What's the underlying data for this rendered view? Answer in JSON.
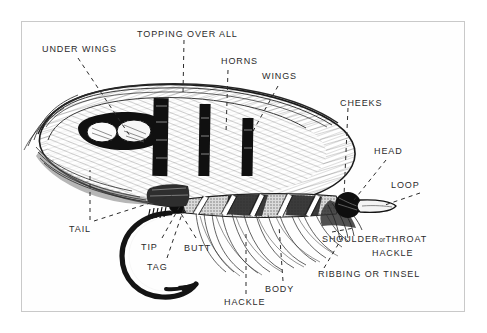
{
  "figure": {
    "kind": "salmon-fly-anatomy-diagram",
    "title_visible": false,
    "background_color": "#ffffff",
    "frame_color": "#c9c9c9",
    "ink_color": "#1a1a1a",
    "label_color": "#2b2b2b"
  },
  "labels": {
    "under_wings": "UNDER WINGS",
    "topping_over_all": "TOPPING OVER ALL",
    "horns": "HORNS",
    "wings": "WINGS",
    "cheeks": "CHEEKS",
    "head": "HEAD",
    "loop": "LOOP",
    "tail": "TAIL",
    "tip": "TIP",
    "tag": "TAG",
    "butt": "BUTT",
    "hackle": "HACKLE",
    "body": "BODY",
    "shoulder_or_throat": "SHOULDER",
    "shoulder_or_word": "or",
    "shoulder_throat": "THROAT",
    "shoulder_hackle": "HACKLE",
    "ribbing_or_tinsel": "RIBBING OR TINSEL"
  },
  "parts": [
    {
      "name": "under-wings",
      "label": "UNDER WINGS"
    },
    {
      "name": "topping-over-all",
      "label": "TOPPING OVER ALL"
    },
    {
      "name": "horns",
      "label": "HORNS"
    },
    {
      "name": "wings",
      "label": "WINGS"
    },
    {
      "name": "cheeks",
      "label": "CHEEKS"
    },
    {
      "name": "head",
      "label": "HEAD"
    },
    {
      "name": "loop",
      "label": "LOOP"
    },
    {
      "name": "tail",
      "label": "TAIL"
    },
    {
      "name": "tip",
      "label": "TIP"
    },
    {
      "name": "tag",
      "label": "TAG"
    },
    {
      "name": "butt",
      "label": "BUTT"
    },
    {
      "name": "hackle",
      "label": "HACKLE"
    },
    {
      "name": "body",
      "label": "BODY"
    },
    {
      "name": "shoulder-or-throat-hackle",
      "label": "SHOULDER or THROAT HACKLE"
    },
    {
      "name": "ribbing-or-tinsel",
      "label": "RIBBING OR TINSEL"
    }
  ]
}
